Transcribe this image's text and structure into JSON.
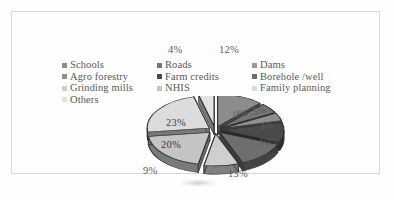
{
  "figure": {
    "border_color": "#d8d8d8",
    "background": "#fefefe"
  },
  "legend": {
    "rows": [
      [
        {
          "label": "Schools",
          "color": "#8c8c8c"
        },
        {
          "label": "Roads",
          "color": "#757575"
        },
        {
          "label": "Dams",
          "color": "#9a9a9a"
        }
      ],
      [
        {
          "label": "Agro forestry",
          "color": "#8f8f8f"
        },
        {
          "label": "Farm credits",
          "color": "#4a4a4a"
        },
        {
          "label": "Borehole /well",
          "color": "#6e6e6e"
        }
      ],
      [
        {
          "label": "Grinding mills",
          "color": "#cfcfcf"
        },
        {
          "label": "NHIS",
          "color": "#c4c4c4"
        },
        {
          "label": "Family planning",
          "color": "#dcdcdc"
        }
      ],
      [
        {
          "label": "Others",
          "color": "#e2e2e2"
        }
      ]
    ]
  },
  "chart_data": {
    "type": "pie",
    "title": "",
    "exploded": true,
    "three_d": true,
    "legend_position": "top",
    "categories": [
      "Schools",
      "Roads",
      "Dams",
      "Agro forestry",
      "Farm credits",
      "Borehole /well",
      "Grinding mills",
      "NHIS",
      "Family planning",
      "Others"
    ],
    "values": [
      12,
      5,
      0,
      4,
      10,
      13,
      9,
      20,
      23,
      4
    ],
    "labels": [
      "12%",
      "5%",
      "0%",
      "4%",
      "10%",
      "13%",
      "9%",
      "20%",
      "23%",
      "4%"
    ],
    "colors": [
      "#8c8c8c",
      "#757575",
      "#9a9a9a",
      "#8f8f8f",
      "#4a4a4a",
      "#6e6e6e",
      "#cfcfcf",
      "#c4c4c4",
      "#dcdcdc",
      "#e2e2e2"
    ],
    "units": "percent",
    "total": 100
  },
  "callouts": [
    {
      "text": "4%",
      "name": "pct-label-others",
      "x": 168,
      "y": 44,
      "tilt": false
    },
    {
      "text": "12%",
      "name": "pct-label-schools",
      "x": 219,
      "y": 44,
      "tilt": false
    },
    {
      "text": "0%",
      "name": "pct-label-dams",
      "x": 233,
      "y": 108,
      "tilt": true
    },
    {
      "text": "5%",
      "name": "pct-label-roads",
      "x": 252,
      "y": 105,
      "tilt": true
    },
    {
      "text": "4%",
      "name": "pct-label-agro-forestry",
      "x": 260,
      "y": 120,
      "tilt": true
    },
    {
      "text": "10%",
      "name": "pct-label-farm-credits",
      "x": 259,
      "y": 136,
      "tilt": false
    },
    {
      "text": "13%",
      "name": "pct-label-borehole-well",
      "x": 228,
      "y": 168,
      "tilt": false
    },
    {
      "text": "9%",
      "name": "pct-label-grinding-mills",
      "x": 143,
      "y": 165,
      "tilt": false
    },
    {
      "text": "20%",
      "name": "pct-label-nhis",
      "x": 161,
      "y": 139,
      "tilt": false
    },
    {
      "text": "23%",
      "name": "pct-label-family-planning",
      "x": 166,
      "y": 117,
      "tilt": false
    }
  ]
}
